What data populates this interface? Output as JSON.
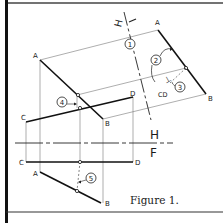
{
  "figure": {
    "caption": "Figure 1.",
    "colors": {
      "ink": "#1a1a1a",
      "thin": "#555555",
      "paper": "#ffffff",
      "border": "#111111"
    }
  },
  "fold_lines": {
    "h1": {
      "label_top": "H",
      "label_bottom": "1",
      "rendered_as": "H—1 (rotated)"
    },
    "hf": {
      "label_top": "H",
      "label_bottom": "F"
    }
  },
  "points": {
    "upper_A": "A",
    "upper_B": "B",
    "upper_C": "C",
    "upper_D": "D",
    "aux_A": "A",
    "aux_B": "B",
    "aux_CD": "CD",
    "lower_A": "A",
    "lower_B": "B",
    "lower_C": "C",
    "lower_D": "D"
  },
  "callouts": [
    {
      "id": "1",
      "label": "1"
    },
    {
      "id": "2",
      "label": "2"
    },
    {
      "id": "3",
      "label": "3"
    },
    {
      "id": "4",
      "label": "4"
    },
    {
      "id": "5",
      "label": "5"
    }
  ],
  "perpendicular_mark": "⊥"
}
